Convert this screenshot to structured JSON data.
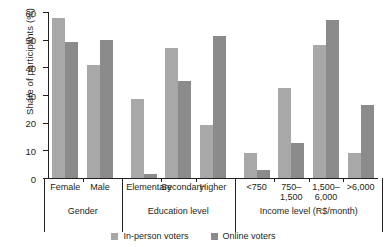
{
  "chart_data": {
    "type": "bar",
    "title": "",
    "xlabel": "",
    "ylabel": "Share of participants (%)",
    "ylim": [
      0,
      60
    ],
    "yticks": [
      0,
      10,
      20,
      30,
      40,
      50,
      60
    ],
    "grid": false,
    "legend_position": "bottom",
    "categories": [
      "Female",
      "Male",
      "Elementary",
      "Secondary",
      "Higher",
      "<750",
      "750–\n1,500",
      "1,500–\n6,000",
      ">6,000"
    ],
    "groups": [
      {
        "name": "Gender",
        "categories": [
          "Female",
          "Male"
        ]
      },
      {
        "name": "Education level",
        "categories": [
          "Elementary",
          "Secondary",
          "Higher"
        ]
      },
      {
        "name": "Income level (R$/month)",
        "categories": [
          "<750",
          "750–1,500",
          "1,500–6,000",
          ">6,000"
        ]
      }
    ],
    "series": [
      {
        "name": "In-person voters",
        "color": "#a8a8a8",
        "values": [
          58,
          41,
          28.5,
          47,
          19,
          9,
          32.5,
          48,
          9
        ]
      },
      {
        "name": "Online voters",
        "color": "#8b8b8b",
        "values": [
          49,
          50,
          1.5,
          35,
          51.5,
          3,
          12.5,
          57,
          26.5
        ]
      }
    ]
  },
  "legend": {
    "items": [
      {
        "label": "In-person voters",
        "color": "#a8a8a8"
      },
      {
        "label": "Online voters",
        "color": "#8b8b8b"
      }
    ]
  }
}
